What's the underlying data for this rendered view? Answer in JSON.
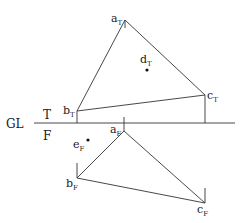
{
  "diagram": {
    "ground_line_label": "GL",
    "top_plane_label": "T",
    "front_plane_label": "F",
    "top_view": {
      "points": [
        {
          "name": "a",
          "sub": "T"
        },
        {
          "name": "b",
          "sub": "T"
        },
        {
          "name": "c",
          "sub": "T"
        },
        {
          "name": "d",
          "sub": "T"
        }
      ]
    },
    "front_view": {
      "points": [
        {
          "name": "a",
          "sub": "F"
        },
        {
          "name": "b",
          "sub": "F"
        },
        {
          "name": "c",
          "sub": "F"
        },
        {
          "name": "e",
          "sub": "F"
        }
      ]
    }
  }
}
